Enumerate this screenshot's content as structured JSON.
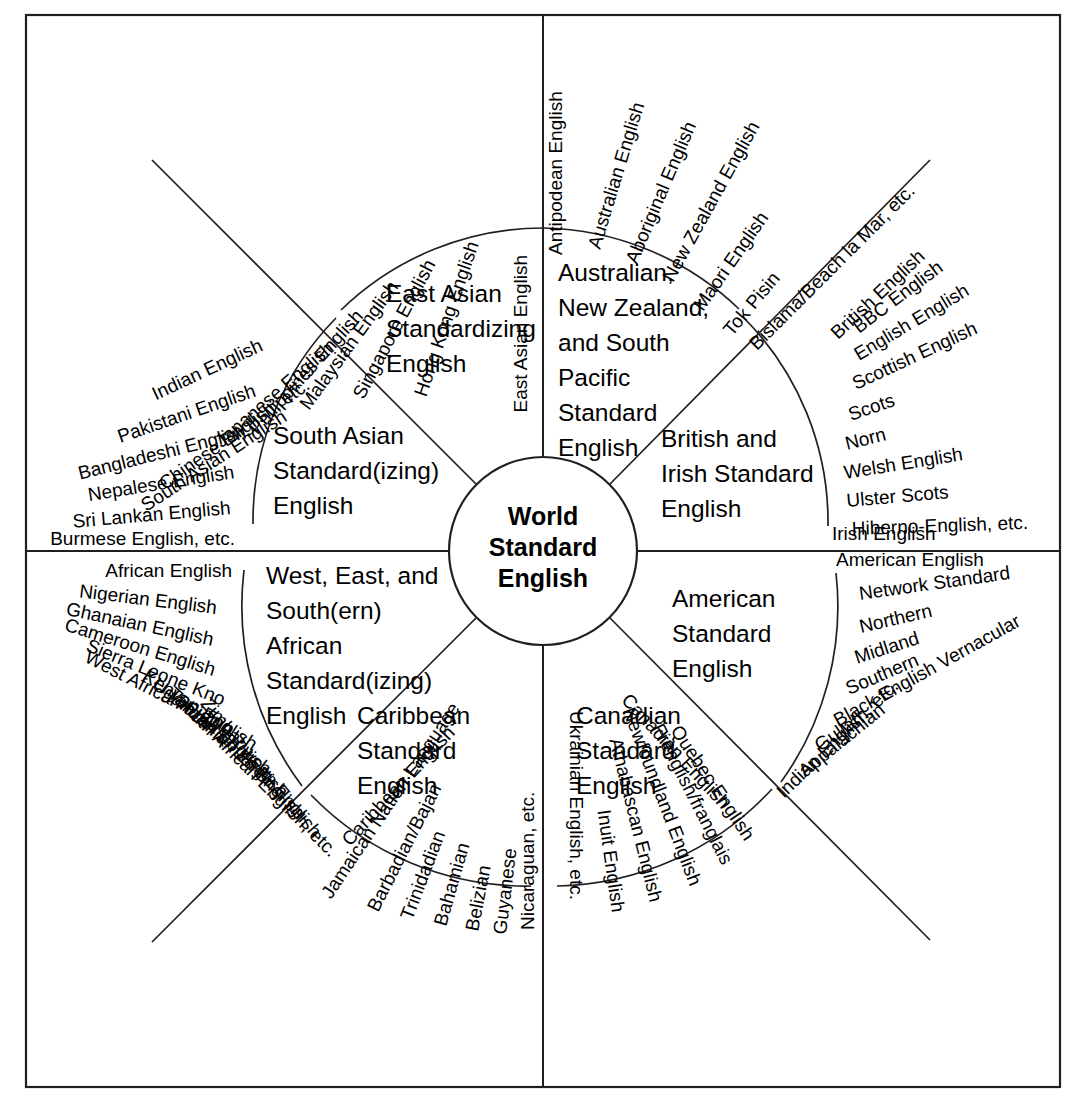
{
  "diagram": {
    "hub": {
      "lines": [
        "World",
        "Standard",
        "English"
      ]
    },
    "sectors": [
      {
        "id": "east-asian",
        "heading": [
          "East Asian",
          "Standardizing",
          "English"
        ],
        "varieties": [
          "East Asian English",
          "Hong Kong English",
          "Singapore English",
          "Malaysian  English",
          "Philippines English",
          "Japanese English",
          "Chinese English, etc."
        ]
      },
      {
        "id": "south-asian",
        "heading": [
          "South Asian",
          "Standard(izing)",
          "English"
        ],
        "varieties": [
          "South Asian English",
          "Indian English",
          "Pakistani English",
          "Bangladeshi  English",
          "Nepalese English",
          "Sri Lankan English",
          "Burmese English, etc."
        ]
      },
      {
        "id": "african",
        "heading": [
          "West, East, and",
          "South(ern)",
          "African",
          "Standard(izing)",
          "English"
        ],
        "varieties": [
          "African English",
          "Nigerian English",
          "Ghanaian English",
          "Cameroon English",
          "Sierra Leone Kno",
          "West African Pidgin",
          "Kenyan English",
          "Ugandan English",
          "Tanzanian English",
          "Zambian English",
          "Zimbabwean English",
          "South African English, etc."
        ]
      },
      {
        "id": "caribbean",
        "heading": [
          "Caribbean",
          "Standard",
          "English"
        ],
        "varieties": [
          "Caribbean English",
          "Jamaican Nation Language",
          "Barbadian/Bajan",
          "Trinidadian",
          "Bahamian",
          "Belizian",
          "Guyanese",
          "Nicaraguan, etc."
        ]
      },
      {
        "id": "canadian",
        "heading": [
          "Canadian",
          "Standard",
          "English"
        ],
        "varieties": [
          "Canadian English",
          "Quebec English",
          "Frenglish/franglais",
          "Newfoundland English",
          "Athabascan English",
          "Inuit English",
          "Ukrainian English, etc."
        ]
      },
      {
        "id": "american",
        "heading": [
          "American",
          "Standard",
          "English"
        ],
        "varieties": [
          "American English",
          "Network Standard",
          "Northern",
          "Midland",
          "Southern",
          "Black English Vernacular",
          "Gullah",
          "Appalachian",
          "Indian English, etc."
        ]
      },
      {
        "id": "british-irish",
        "heading": [
          "British and",
          "Irish Standard",
          "English"
        ],
        "varieties": [
          "British English",
          "BBC English",
          "English English",
          "Scottish English",
          "Scots",
          "Norn",
          "Welsh English",
          "Ulster Scots",
          "Hiberno-English, etc.",
          "Irish English"
        ]
      },
      {
        "id": "australasian",
        "heading": [
          "Australian,",
          "New Zealand,",
          "and South",
          "Pacific",
          "Standard",
          "English"
        ],
        "varieties": [
          "Antipodean English",
          "Australian English",
          "Aboriginal English",
          "New Zealand English",
          "Maori English",
          "Tok Pisin",
          "Bislama/Beach la Mar, etc."
        ]
      }
    ]
  },
  "colors": {
    "ink": "#231f20",
    "background": "#ffffff"
  }
}
